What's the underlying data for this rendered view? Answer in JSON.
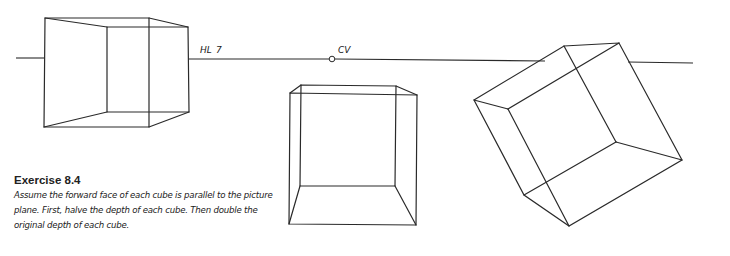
{
  "figure": {
    "labels": {
      "horizon_line": "HL",
      "horizon_mark": "7",
      "center_of_vision": "CV"
    },
    "cubes": [
      {
        "name": "cube-left",
        "description": "Cube seen to the left of center, straddling horizon line"
      },
      {
        "name": "cube-center",
        "description": "Cube below horizon, near center of vision"
      },
      {
        "name": "cube-right",
        "description": "Rotated cube to the right, straddling horizon line"
      }
    ]
  },
  "caption": {
    "title": "Exercise 8.4",
    "body": "Assume the forward face of each cube is parallel to the picture plane. First, halve the depth of each cube. Then double the original depth of each cube."
  }
}
